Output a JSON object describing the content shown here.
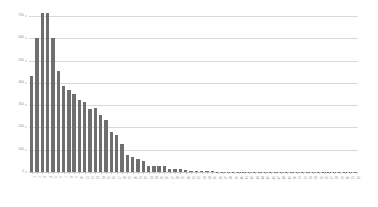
{
  "chart_data": {
    "type": "bar",
    "title": "",
    "subtitle": "",
    "xlabel": "",
    "ylabel": "",
    "ylim": [
      0,
      700
    ],
    "ytick_labels": [
      "700",
      "600",
      "500",
      "400",
      "300",
      "200",
      "100",
      "0"
    ],
    "ytick_values": [
      700,
      600,
      500,
      400,
      300,
      200,
      100,
      0
    ],
    "grid": "horizontal",
    "legend": "none",
    "bar_color": "#706f6f",
    "gridline_color": "#d9d9d9",
    "axis_text_color": "#8c8c8c",
    "categories": [
      "1",
      "2",
      "3",
      "4",
      "5",
      "6",
      "7",
      "8",
      "9",
      "10",
      "11",
      "12",
      "13",
      "14",
      "15",
      "16",
      "17",
      "18",
      "19",
      "20",
      "21",
      "22",
      "23",
      "24",
      "25",
      "26",
      "27",
      "28",
      "29",
      "30",
      "31",
      "32",
      "33",
      "34",
      "35",
      "36",
      "37",
      "38",
      "39",
      "40",
      "41",
      "42",
      "43",
      "44",
      "45",
      "46",
      "47",
      "48",
      "49",
      "50",
      "51",
      "52",
      "53",
      "54",
      "55",
      "56",
      "57",
      "58",
      "59",
      "60",
      "61",
      "62"
    ],
    "values": [
      432,
      600,
      712,
      715,
      601,
      455,
      386,
      369,
      350,
      323,
      313,
      281,
      288,
      256,
      234,
      181,
      165,
      124,
      78,
      68,
      60,
      51,
      26,
      25,
      27,
      26,
      14,
      13,
      12,
      8,
      6,
      5,
      4,
      3,
      3,
      2,
      2,
      2,
      2,
      1,
      1,
      1,
      1,
      1,
      1,
      1,
      1,
      1,
      1,
      1,
      1,
      1,
      1,
      1,
      1,
      1,
      1,
      1,
      1,
      1,
      1,
      1
    ]
  }
}
